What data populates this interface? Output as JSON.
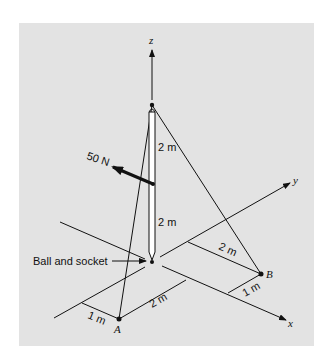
{
  "figure": {
    "background_color": "#e3e3e3",
    "axes": {
      "x": "x",
      "y": "y",
      "z": "z"
    },
    "force_label": "50 N",
    "pole_upper_label": "2 m",
    "pole_lower_label": "2 m",
    "support_label": "Ball and socket",
    "point_a": "A",
    "point_b": "B",
    "dim_a_offset": "1 m",
    "dim_a_along": "2 m",
    "dim_b_offset": "2 m",
    "dim_b_along": "1 m"
  }
}
